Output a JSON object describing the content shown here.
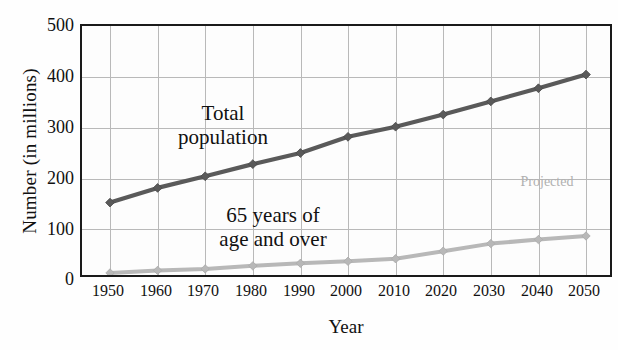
{
  "chart_data": {
    "type": "line",
    "title": "",
    "xlabel": "Year",
    "ylabel": "Number (in millions)",
    "categories": [
      "1950",
      "1960",
      "1970",
      "1980",
      "1990",
      "2000",
      "2010",
      "2020",
      "2030",
      "2040",
      "2050"
    ],
    "x": [
      1950,
      1960,
      1970,
      1980,
      1990,
      2000,
      2010,
      2020,
      2030,
      2040,
      2050
    ],
    "xlim": [
      1950,
      2050
    ],
    "ylim": [
      0,
      500
    ],
    "yticks": [
      0,
      100,
      200,
      300,
      400,
      500
    ],
    "grid": true,
    "legend_position": "in-plot-annotations",
    "series": [
      {
        "name": "Total population",
        "color": "#5a5a5a",
        "marker": "diamond",
        "values": [
          151,
          180,
          203,
          227,
          249,
          281,
          301,
          325,
          351,
          377,
          404
        ]
      },
      {
        "name": "65 years of age and over",
        "color": "#b8b8b8",
        "marker": "diamond",
        "values": [
          12,
          17,
          20,
          26,
          31,
          35,
          40,
          55,
          70,
          78,
          85
        ]
      }
    ],
    "annotations": [
      {
        "id": "total-population",
        "text": "Total\npopulation",
        "line1": "Total",
        "line2": "population"
      },
      {
        "id": "65-and-over",
        "text": "65 years of\nage and over",
        "line1": "65 years of",
        "line2": "age and over"
      },
      {
        "id": "projected",
        "text": "Projected",
        "color": "#b0b0b0"
      }
    ]
  },
  "axes": {
    "y_title": "Number (in millions)",
    "x_title": "Year",
    "y_tick_labels": [
      "500",
      "400",
      "300",
      "200",
      "100",
      "0"
    ],
    "x_tick_labels": [
      "1950",
      "1960",
      "1970",
      "1980",
      "1990",
      "2000",
      "2010",
      "2020",
      "2030",
      "2040",
      "2050"
    ]
  },
  "annotations": {
    "total_population_line1": "Total",
    "total_population_line2": "population",
    "over65_line1": "65 years of",
    "over65_line2": "age and over",
    "projected": "Projected"
  },
  "colors": {
    "total_population": "#5a5a5a",
    "over65": "#b8b8b8",
    "axis": "#1a1a1a",
    "grid": "#b9b9b9",
    "projected_label": "#b0b0b0"
  }
}
